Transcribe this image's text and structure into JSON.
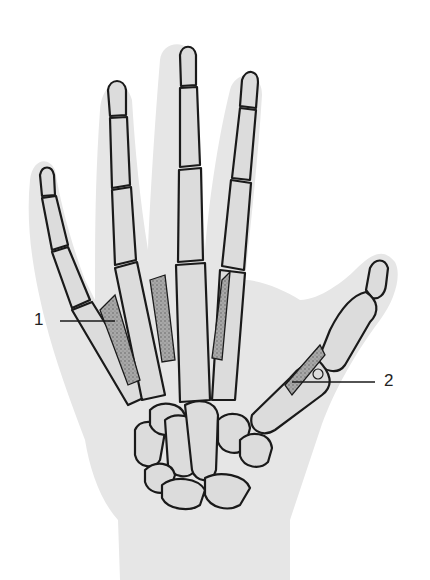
{
  "figure": {
    "labels": [
      {
        "id": "1",
        "text": "1",
        "side": "left",
        "target": "dorsal interosseous muscle (second digit)"
      },
      {
        "id": "2",
        "text": "2",
        "side": "right",
        "target": "first metacarpal / thumb muscle"
      }
    ],
    "colors": {
      "background": "#ffffff",
      "skin_silhouette": "#e6e6e6",
      "bone_fill": "#dcdcdc",
      "outline": "#1a1a1a",
      "muscle_shading": "#8a8a8a"
    }
  }
}
